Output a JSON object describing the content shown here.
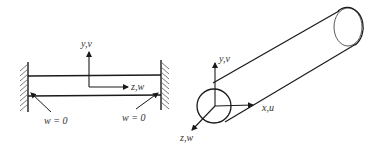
{
  "figure": {
    "left_panel": {
      "description": "Beam clamped between two fixed walls",
      "axis_labels": {
        "vertical": "y,v",
        "horizontal": "z,w"
      },
      "boundary_conditions": {
        "left": "w = 0",
        "right": "w = 0"
      }
    },
    "right_panel": {
      "description": "Cylindrical rod with local coordinate axes",
      "axis_labels": {
        "vertical": "y,v",
        "axial": "x,u",
        "out_of_plane": "z,w"
      }
    },
    "colors": {
      "stroke": "#1a1a1a",
      "hatch": "#555555",
      "text": "#333333",
      "background": "#ffffff"
    }
  }
}
